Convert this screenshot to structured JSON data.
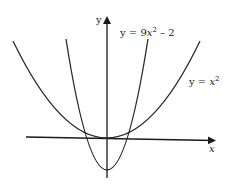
{
  "figure": {
    "y_axis_label": "y",
    "x_axis_label": "x",
    "curves": [
      {
        "name": "narrow-parabola",
        "label_prefix": "y = 9",
        "label_var": "x",
        "label_exp": "2",
        "label_suffix": " – 2",
        "equation": "y = 9x^2 - 2"
      },
      {
        "name": "wide-parabola",
        "label_prefix": "y = ",
        "label_var": "x",
        "label_exp": "2",
        "label_suffix": "",
        "equation": "y = x^2"
      }
    ],
    "stroke_color": "#2a2a2a"
  }
}
